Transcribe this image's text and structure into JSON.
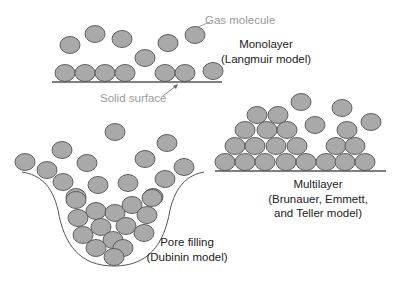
{
  "diagram": {
    "colors": {
      "molecule_fill": "#a9a9a9",
      "molecule_stroke": "#555555",
      "surface": "#555555",
      "label": "#222222",
      "annotation": "#9a9a9a"
    },
    "molecule_size": {
      "rx": 10,
      "ry": 8.5
    },
    "annotations": {
      "gas_molecule": "Gas molecule",
      "solid_surface": "Solid surface"
    },
    "panels": {
      "monolayer": {
        "title": "Monolayer",
        "subtitle": "(Langmuir model)",
        "surface": {
          "x1": 52,
          "y1": 82,
          "x2": 222,
          "y2": 82
        },
        "molecules": [
          [
            70,
            45
          ],
          [
            95,
            34
          ],
          [
            122,
            39
          ],
          [
            145,
            58
          ],
          [
            168,
            43
          ],
          [
            195,
            35
          ],
          [
            65,
            73
          ],
          [
            85,
            73
          ],
          [
            105,
            73
          ],
          [
            125,
            73
          ],
          [
            165,
            73
          ],
          [
            185,
            73
          ],
          [
            213,
            71
          ]
        ]
      },
      "multilayer": {
        "title": "Multilayer",
        "subtitle_1": "(Brunauer, Emmett,",
        "subtitle_2": "and Teller model)",
        "surface": {
          "x1": 215,
          "y1": 171,
          "x2": 386,
          "y2": 171
        },
        "molecules": [
          [
            257,
            115
          ],
          [
            278,
            115
          ],
          [
            245,
            130
          ],
          [
            267,
            130
          ],
          [
            287,
            130
          ],
          [
            235,
            146
          ],
          [
            255,
            146
          ],
          [
            276,
            146
          ],
          [
            297,
            146
          ],
          [
            225,
            162
          ],
          [
            245,
            162
          ],
          [
            265,
            162
          ],
          [
            286,
            162
          ],
          [
            306,
            162
          ],
          [
            326,
            162
          ],
          [
            345,
            162
          ],
          [
            365,
            162
          ],
          [
            336,
            146
          ],
          [
            355,
            146
          ],
          [
            347,
            130
          ],
          [
            301,
            102
          ],
          [
            342,
            108
          ],
          [
            315,
            125
          ],
          [
            371,
            122
          ]
        ]
      },
      "pore_filling": {
        "title": "Pore filling",
        "subtitle": "(Dubinin model)",
        "molecules": [
          [
            115,
            132
          ],
          [
            62,
            150
          ],
          [
            167,
            143
          ],
          [
            25,
            162
          ],
          [
            87,
            163
          ],
          [
            145,
            159
          ],
          [
            184,
            167
          ],
          [
            47,
            170
          ],
          [
            63,
            182
          ],
          [
            98,
            185
          ],
          [
            128,
            183
          ],
          [
            165,
            179
          ],
          [
            76,
            197
          ],
          [
            153,
            197
          ],
          [
            76,
            200
          ],
          [
            96,
            211
          ],
          [
            115,
            213
          ],
          [
            132,
            205
          ],
          [
            152,
            198
          ],
          [
            78,
            218
          ],
          [
            101,
            227
          ],
          [
            126,
            226
          ],
          [
            147,
            215
          ],
          [
            83,
            235
          ],
          [
            113,
            240
          ],
          [
            144,
            233
          ],
          [
            96,
            248
          ],
          [
            123,
            248
          ],
          [
            114,
            257
          ]
        ]
      }
    }
  }
}
